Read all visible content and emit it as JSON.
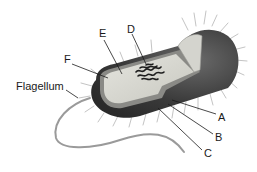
{
  "diagram": {
    "labels": [
      {
        "id": "A",
        "text": "A"
      },
      {
        "id": "B",
        "text": "B"
      },
      {
        "id": "C",
        "text": "C"
      },
      {
        "id": "D",
        "text": "D"
      },
      {
        "id": "E",
        "text": "E"
      },
      {
        "id": "F",
        "text": "F"
      },
      {
        "id": "flagellum",
        "text": "Flagellum"
      }
    ],
    "colors": {
      "background": "#ffffff",
      "outer_dark": "#3a3a3a",
      "cytoplasm": "#d8d8d2",
      "membrane_edge": "#8a8a86",
      "dna": "#1e1e1e",
      "pili": "#c8c8c8",
      "flagellum": "#9a9a9a",
      "leader_line": "#1a1a1a"
    }
  }
}
